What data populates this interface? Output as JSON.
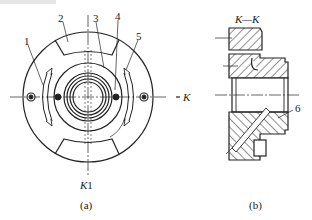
{
  "figure_a": {
    "caption": "(a)",
    "callouts": [
      "1",
      "2",
      "3",
      "4",
      "5"
    ],
    "section_mark_right": "K",
    "section_mark_bottom": "K",
    "section_mark_bottom_suffix": "1"
  },
  "figure_b": {
    "caption": "(b)",
    "section_title": "K—K",
    "callouts": [
      "6"
    ]
  }
}
